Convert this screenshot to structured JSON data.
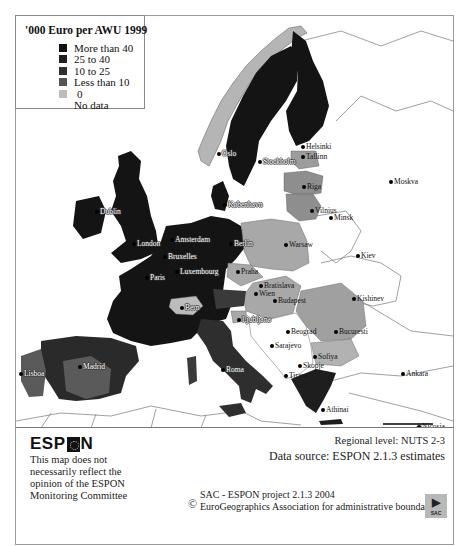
{
  "legend": {
    "title": "'000 Euro per AWU 1999",
    "items": [
      {
        "label": "More than 40",
        "color": "#111111"
      },
      {
        "label": "25 to 40",
        "color": "#1e1e1e"
      },
      {
        "label": "10 to 25",
        "color": "#2f2f2f"
      },
      {
        "label": "Less than 10",
        "color": "#555555"
      },
      {
        "label": "0",
        "color": "#bdbdbd"
      },
      {
        "label": "No data",
        "color": ""
      }
    ]
  },
  "map": {
    "colors": {
      "high": "#141414",
      "mid_high": "#202020",
      "mid": "#333333",
      "low": "#5a5a5a",
      "zero": "#b5b5b5",
      "nodata": "#ffffff",
      "border": "#6a6a6a",
      "sea": "#ffffff"
    },
    "cities": [
      {
        "name": "Oslo",
        "x": 218,
        "y": 153
      },
      {
        "name": "Helsinki",
        "x": 302,
        "y": 146
      },
      {
        "name": "Tallinn",
        "x": 302,
        "y": 156
      },
      {
        "name": "Stockholm",
        "x": 259,
        "y": 161
      },
      {
        "name": "Moskva",
        "x": 390,
        "y": 181
      },
      {
        "name": "Riga",
        "x": 303,
        "y": 186
      },
      {
        "name": "Dublin",
        "x": 96,
        "y": 211
      },
      {
        "name": "København",
        "x": 224,
        "y": 204
      },
      {
        "name": "Vilnius",
        "x": 311,
        "y": 210
      },
      {
        "name": "Minsk",
        "x": 330,
        "y": 217
      },
      {
        "name": "London",
        "x": 133,
        "y": 243
      },
      {
        "name": "Amsterdam",
        "x": 171,
        "y": 239
      },
      {
        "name": "Berlin",
        "x": 230,
        "y": 243
      },
      {
        "name": "Warsaw",
        "x": 285,
        "y": 244
      },
      {
        "name": "Kiev",
        "x": 357,
        "y": 255
      },
      {
        "name": "Bruxelles",
        "x": 164,
        "y": 256
      },
      {
        "name": "Luxembourg",
        "x": 176,
        "y": 271
      },
      {
        "name": "Paris",
        "x": 146,
        "y": 277
      },
      {
        "name": "Praha",
        "x": 237,
        "y": 271
      },
      {
        "name": "Bratislava",
        "x": 260,
        "y": 285
      },
      {
        "name": "Wien",
        "x": 255,
        "y": 293
      },
      {
        "name": "Budapest",
        "x": 274,
        "y": 300
      },
      {
        "name": "Kishinev",
        "x": 353,
        "y": 298
      },
      {
        "name": "Bern",
        "x": 181,
        "y": 307
      },
      {
        "name": "Ljubljana",
        "x": 238,
        "y": 319
      },
      {
        "name": "Beograd",
        "x": 287,
        "y": 331
      },
      {
        "name": "Bucuresti",
        "x": 335,
        "y": 331
      },
      {
        "name": "Sarajevo",
        "x": 271,
        "y": 345
      },
      {
        "name": "Sofiya",
        "x": 314,
        "y": 356
      },
      {
        "name": "Lisboa",
        "x": 20,
        "y": 373
      },
      {
        "name": "Madrid",
        "x": 79,
        "y": 366
      },
      {
        "name": "Roma",
        "x": 222,
        "y": 369
      },
      {
        "name": "Skopje",
        "x": 299,
        "y": 365
      },
      {
        "name": "Tirane",
        "x": 285,
        "y": 375
      },
      {
        "name": "Ankara",
        "x": 402,
        "y": 373
      },
      {
        "name": "Athinai",
        "x": 322,
        "y": 409
      },
      {
        "name": "Nicosia",
        "x": 418,
        "y": 426
      },
      {
        "name": "Valetta",
        "x": 237,
        "y": 439
      }
    ],
    "scale_bar_label": "500 km"
  },
  "footer": {
    "logo": {
      "left": "ESP",
      "right": "N"
    },
    "disclaimer": "This map does not necessarily reflect the opinion of the ESPON Monitoring Committee",
    "regional_level": "Regional level: NUTS 2-3",
    "data_source": "Data source: ESPON 2.1.3 estimates",
    "copyright_symbol": "©",
    "credit_line1": "SAC - ESPON project 2.1.3 2004",
    "credit_line2": "EuroGeographics Association for administrative boundaries",
    "sac_logo_text": "SAC"
  }
}
